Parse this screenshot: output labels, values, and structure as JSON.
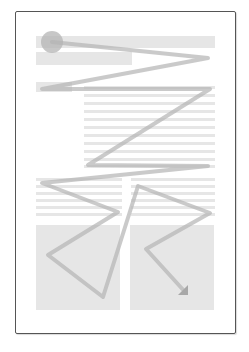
{
  "diagram": {
    "colors": {
      "background": "#ffffff",
      "page_border": "#555555",
      "placeholder_block": "#e6e6e6",
      "path_stroke": "#b4b4b4"
    },
    "page": {
      "x": 15,
      "y": 11,
      "width": 219,
      "height": 321
    },
    "blocks": {
      "header_bar": {
        "x": 36,
        "y": 36,
        "width": 179,
        "height": 12
      },
      "subheader_bar": {
        "x": 36,
        "y": 52,
        "width": 96,
        "height": 13
      },
      "side_label": {
        "x": 36,
        "y": 82,
        "width": 36,
        "height": 10
      },
      "body_lines": {
        "x": 84,
        "width": 131,
        "height": 3,
        "y_values": [
          86,
          94,
          102,
          110,
          118,
          126,
          134,
          142,
          150,
          158,
          165
        ]
      },
      "left_column_lines": {
        "x": 36,
        "width": 86,
        "height": 3,
        "y_values": [
          178,
          185,
          192,
          199,
          206,
          213
        ]
      },
      "right_column_lines": {
        "x": 131,
        "width": 84,
        "height": 3,
        "y_values": [
          178,
          185,
          192,
          199,
          206,
          213
        ]
      },
      "left_image": {
        "x": 36,
        "y": 225,
        "width": 84,
        "height": 85
      },
      "right_image": {
        "x": 130,
        "y": 225,
        "width": 84,
        "height": 85
      }
    },
    "start_marker": {
      "shape": "circle",
      "cx": 52,
      "cy": 42,
      "r": 11
    },
    "path_points": [
      [
        52,
        42
      ],
      [
        208,
        58
      ],
      [
        42,
        89
      ],
      [
        210,
        89
      ],
      [
        88,
        165
      ],
      [
        208,
        166
      ],
      [
        42,
        183
      ],
      [
        118,
        212
      ],
      [
        48,
        255
      ],
      [
        103,
        297
      ],
      [
        138,
        186
      ],
      [
        210,
        213
      ],
      [
        146,
        249
      ],
      [
        186,
        293
      ]
    ],
    "end_marker": {
      "shape": "arrowhead",
      "direction": "down-right",
      "x": 188,
      "y": 295
    }
  }
}
